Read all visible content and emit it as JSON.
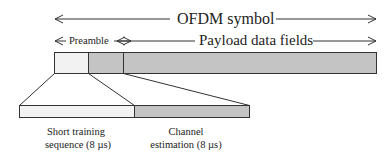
{
  "title": "OFDM symbol",
  "preamble_label": "Preamble",
  "payload_label": "Payload data fields",
  "segments": {
    "short_training": {
      "line1": "Short training",
      "line2": "sequence (8 µs)"
    },
    "channel_estimation": {
      "line1": "Channel",
      "line2": "estimation (8 µs)"
    }
  },
  "colors": {
    "light_segment": "#f2f2f2",
    "dark_segment": "#c4c4c4",
    "stroke": "#333333"
  }
}
